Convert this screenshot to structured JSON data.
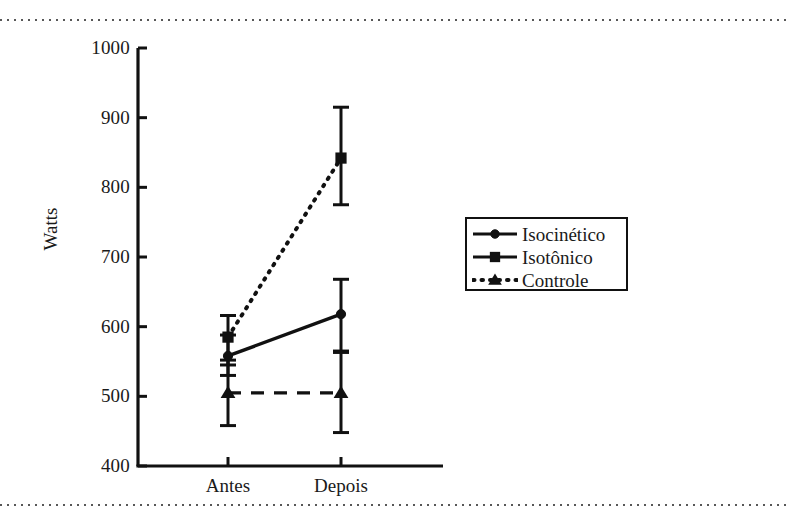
{
  "chart_data": {
    "type": "line",
    "title": "",
    "subtitle": "",
    "xlabel": "",
    "ylabel": "Watts",
    "categories": [
      "Antes",
      "Depois"
    ],
    "ylim": [
      400,
      1000
    ],
    "yticks": [
      400,
      500,
      600,
      700,
      800,
      900,
      1000
    ],
    "ytick_labels": [
      "400",
      "500",
      "600",
      "700",
      "800",
      "900",
      "1000"
    ],
    "grid": false,
    "legend_position": "right",
    "error_bars": "standard deviation",
    "series": [
      {
        "name": "Isocinético",
        "marker": "circle",
        "linestyle": "solid",
        "color": "#111111",
        "values": [
          558,
          618
        ],
        "err_low": [
          530,
          565
        ],
        "err_high": [
          588,
          668
        ]
      },
      {
        "name": "Isotônico",
        "marker": "square",
        "linestyle": "dotted",
        "color": "#111111",
        "values": [
          585,
          842
        ],
        "err_low": [
          545,
          775
        ],
        "err_high": [
          616,
          915
        ]
      },
      {
        "name": "Controle",
        "marker": "triangle",
        "linestyle": "dashed",
        "color": "#111111",
        "values": [
          505,
          505
        ],
        "err_low": [
          458,
          448
        ],
        "err_high": [
          552,
          563
        ]
      }
    ]
  },
  "legend": {
    "entries": [
      {
        "label": "Isocinético",
        "marker": "circle",
        "linestyle": "solid"
      },
      {
        "label": "Isotônico",
        "marker": "square",
        "linestyle": "solid"
      },
      {
        "label": "Controle",
        "marker": "triangle",
        "linestyle": "dotted"
      }
    ]
  },
  "axes": {
    "y_title": "Watts",
    "y_tick_labels": [
      "1000",
      "900",
      "800",
      "700",
      "600",
      "500",
      "400"
    ],
    "x_tick_labels": [
      "Antes",
      "Depois"
    ]
  },
  "colors": {
    "ink": "#111111",
    "paper": "#ffffff",
    "scan_rule": "#3a3a3a"
  }
}
